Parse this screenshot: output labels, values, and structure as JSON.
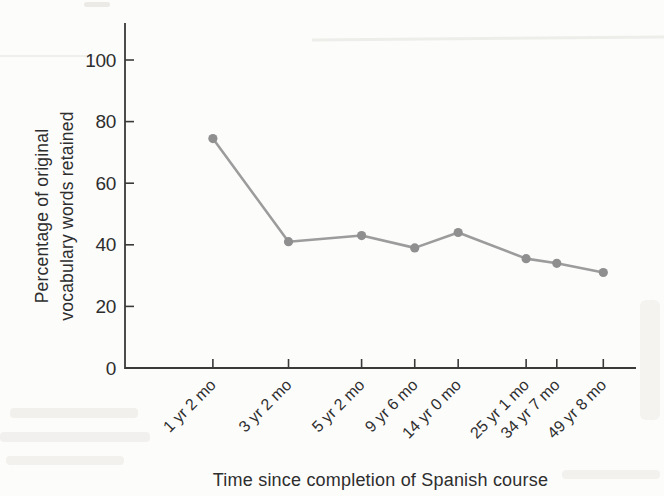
{
  "page": {
    "background": "#fcfcfb"
  },
  "chart_data": {
    "type": "line",
    "title": "",
    "xlabel": "Time since completion of Spanish course",
    "ylabel": "Percentage of original vocabulary words retained",
    "ylabel_lines": [
      "Percentage of original",
      "vocabulary words retained"
    ],
    "categories": [
      "1 yr 2 mo",
      "3 yr 2 mo",
      "5 yr 2 mo",
      "9 yr 6 mo",
      "14 yr 0 mo",
      "25 yr 1 mo",
      "34 yr 7 mo",
      "49 yr 8 mo"
    ],
    "values": [
      74.5,
      41,
      43,
      39,
      44,
      35.5,
      34,
      31
    ],
    "y_ticks": [
      0,
      20,
      40,
      60,
      80,
      100
    ],
    "ylim": [
      0,
      112
    ],
    "grid": false,
    "legend": "none",
    "x_fractions": [
      0.172,
      0.32,
      0.463,
      0.567,
      0.652,
      0.785,
      0.845,
      0.936
    ],
    "line_color": "#9c9c9c",
    "marker_color": "#8f8f8f",
    "axis_color": "#3a3a3a",
    "text_color": "#2e2e2e"
  }
}
